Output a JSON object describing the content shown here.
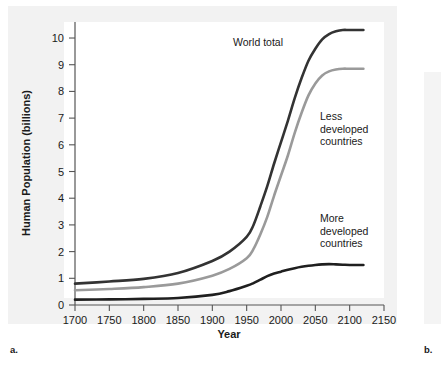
{
  "figure": {
    "label_a": "a.",
    "label_b": "b."
  },
  "chart_data": {
    "type": "line",
    "title": "",
    "xlabel": "Year",
    "ylabel": "Human Population (billions)",
    "xlim": [
      1700,
      2150
    ],
    "ylim": [
      0,
      10.6
    ],
    "grid": false,
    "legend_position": "inline-annotations",
    "xticks": [
      1700,
      1750,
      1800,
      1850,
      1900,
      1950,
      2000,
      2050,
      2100,
      2150
    ],
    "yticks": [
      0,
      1,
      2,
      3,
      4,
      5,
      6,
      7,
      8,
      9,
      10
    ],
    "x": [
      1700,
      1750,
      1800,
      1850,
      1900,
      1925,
      1950,
      1960,
      1970,
      1980,
      1990,
      2000,
      2010,
      2020,
      2030,
      2040,
      2050,
      2060,
      2070,
      2080,
      2090,
      2100,
      2120
    ],
    "series": [
      {
        "name": "World total",
        "color": "#333333",
        "width": 2.6,
        "annotation": "World total",
        "values": [
          0.8,
          0.88,
          0.98,
          1.2,
          1.65,
          2.0,
          2.55,
          3.0,
          3.7,
          4.45,
          5.3,
          6.1,
          6.9,
          7.75,
          8.5,
          9.15,
          9.6,
          9.95,
          10.15,
          10.25,
          10.3,
          10.3,
          10.3
        ]
      },
      {
        "name": "Less developed countries",
        "color": "#9a9a9a",
        "width": 2.6,
        "annotation": "Less\ndeveloped\ncountries",
        "values": [
          0.55,
          0.6,
          0.67,
          0.8,
          1.1,
          1.35,
          1.75,
          2.1,
          2.65,
          3.3,
          4.1,
          4.85,
          5.6,
          6.45,
          7.2,
          7.85,
          8.3,
          8.6,
          8.75,
          8.82,
          8.85,
          8.85,
          8.85
        ]
      },
      {
        "name": "More developed countries",
        "color": "#1f1f1f",
        "width": 2.6,
        "annotation": "More\ndeveloped\ncountries",
        "values": [
          0.2,
          0.21,
          0.23,
          0.26,
          0.38,
          0.52,
          0.72,
          0.82,
          0.95,
          1.08,
          1.18,
          1.25,
          1.32,
          1.38,
          1.43,
          1.47,
          1.5,
          1.52,
          1.53,
          1.52,
          1.51,
          1.5,
          1.5
        ]
      }
    ],
    "annotations": [
      {
        "text": "World total",
        "lines": [
          "World total"
        ]
      },
      {
        "text": "Less developed countries",
        "lines": [
          "Less",
          "developed",
          "countries"
        ]
      },
      {
        "text": "More developed countries",
        "lines": [
          "More",
          "developed",
          "countries"
        ]
      }
    ]
  }
}
